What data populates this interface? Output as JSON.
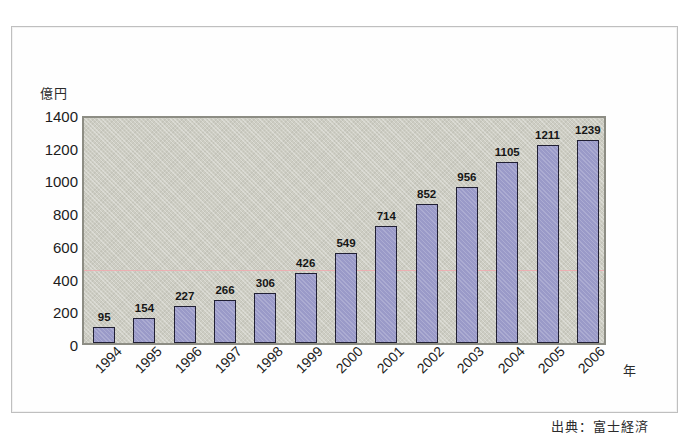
{
  "figure": {
    "source_note": "出典：富士経済"
  },
  "chart_data": {
    "type": "bar",
    "title": "",
    "subtitle": "",
    "xlabel": "年",
    "ylabel": "億円",
    "categories": [
      "1994",
      "1995",
      "1996",
      "1997",
      "1998",
      "1999",
      "2000",
      "2001",
      "2002",
      "2003",
      "2004",
      "2005",
      "2006"
    ],
    "values": [
      95,
      154,
      227,
      266,
      306,
      426,
      549,
      714,
      852,
      956,
      1105,
      1211,
      1239
    ],
    "data_labels": [
      "95",
      "154",
      "227",
      "266",
      "306",
      "426",
      "549",
      "714",
      "852",
      "956",
      "1105",
      "1211",
      "1239"
    ],
    "ylim": [
      0,
      1400
    ],
    "ytick_step": 200,
    "ytick_labels": [
      "1400",
      "1200",
      "1000",
      "800",
      "600",
      "400",
      "200",
      "0"
    ],
    "ytick_values": [
      1400,
      1200,
      1000,
      800,
      600,
      400,
      200,
      0
    ],
    "grid": false,
    "legend": "none",
    "xtick_rotation": -45,
    "annotations": [
      {
        "name": "reference-line",
        "type": "hline",
        "value": 440,
        "color": "#f0a9ae"
      }
    ],
    "colors": {
      "bar_fill": "#9a9ac8",
      "bar_border": "#201f33",
      "plot_background": "#cdcdc3",
      "plot_border": "#8d8d84",
      "reference_line": "#f0a9ae",
      "text": "#1c1c1c"
    }
  }
}
